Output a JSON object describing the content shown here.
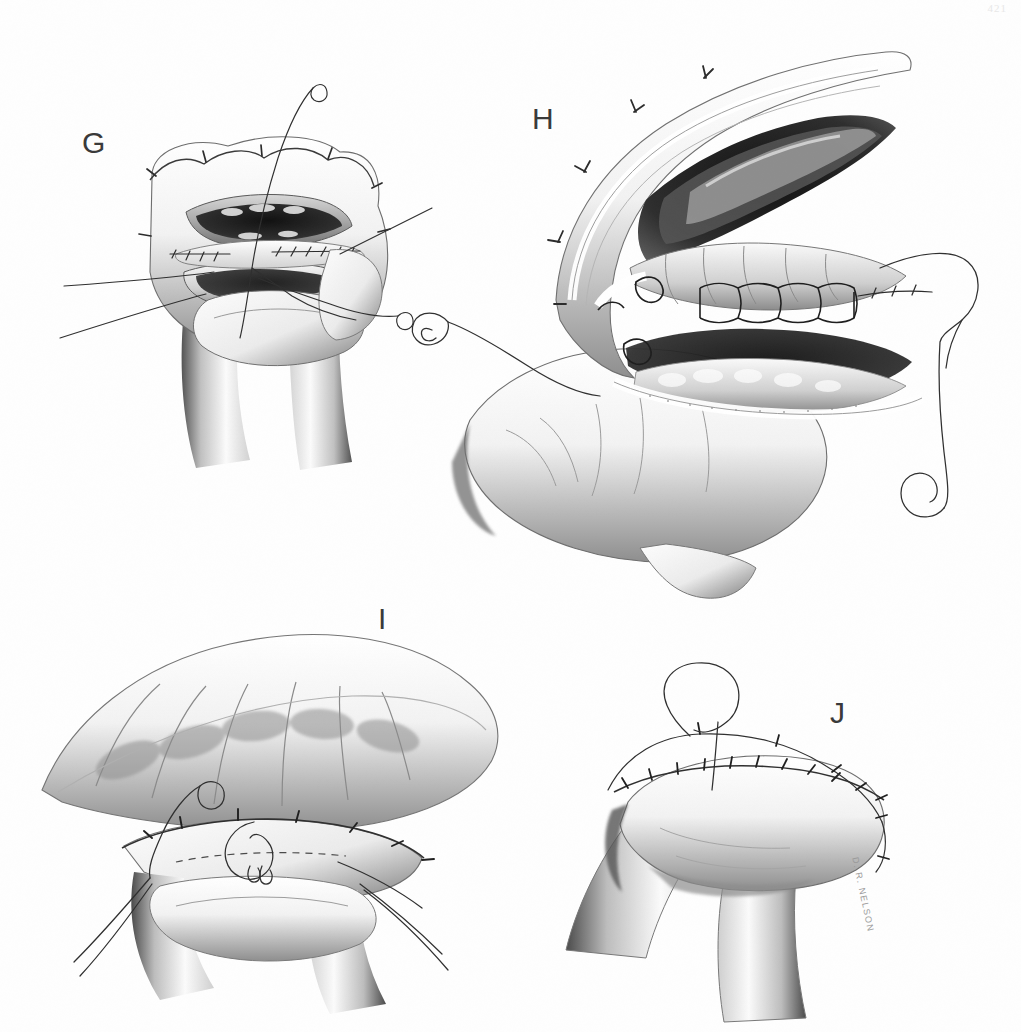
{
  "document": {
    "type": "surgical-atlas-plate",
    "medium": "graphite and wash illustration",
    "page_number": "421",
    "artist_signature": "D. R. NELSON",
    "background_color": "#ffffff",
    "ink_color": "#2b2b2b"
  },
  "panels": [
    {
      "id": "G",
      "label": "G",
      "label_x": 88,
      "label_y": 128,
      "title": "Posterior inner layer continuous suture",
      "description": "End-to-end bowel anastomosis viewed from the front with the lumen held open by stay sutures; a continuous inner-layer suture is being placed across the posterior wall, with two needled suture ends emerging above and to the right.",
      "elements": [
        "open bowel lumen",
        "stay sutures",
        "continuous posterior suture line",
        "curved needle upper",
        "curved needle right",
        "traction threads"
      ]
    },
    {
      "id": "H",
      "label": "H",
      "label_x": 543,
      "label_y": 104,
      "title": "Anterior mucosal layer, magnified view",
      "description": "High-magnification oblique view of the opened anastomosis showing mucosal folds, the dark lumen, and a row of snug over-and-over inner-layer loops tied across the anterior mucosa. A needle with trailing thread exits at left and another large loop of suture with a curved needle hangs at right.",
      "elements": [
        "mucosal folds",
        "serosal edge",
        "running inner-layer loops",
        "curved needle left",
        "suture loop right",
        "curved needle right",
        "mesenteric vessels"
      ]
    },
    {
      "id": "I",
      "label": "I",
      "label_x": 385,
      "label_y": 606,
      "title": "Anterior seromuscular layer being placed",
      "description": "Anastomosis rotated to show the anterior surface; the bowel is being closed with interrupted seromuscular sutures while a knot loop and its needle remain untied near the midline, with free suture tails drawn to each side.",
      "elements": [
        "anterior bowel wall",
        "interrupted seromuscular sutures",
        "untied knot loop",
        "curved needle",
        "suture tails"
      ]
    },
    {
      "id": "J",
      "label": "J",
      "label_x": 838,
      "label_y": 700,
      "title": "Completed anastomosis",
      "description": "The finished end-to-end anastomosis viewed obliquely, with an evenly spaced completed outer suture line along the full circumference and one final loop of suture still long at the top.",
      "elements": [
        "completed suture line",
        "final suture loop",
        "bowel limbs",
        "serosa"
      ]
    }
  ]
}
